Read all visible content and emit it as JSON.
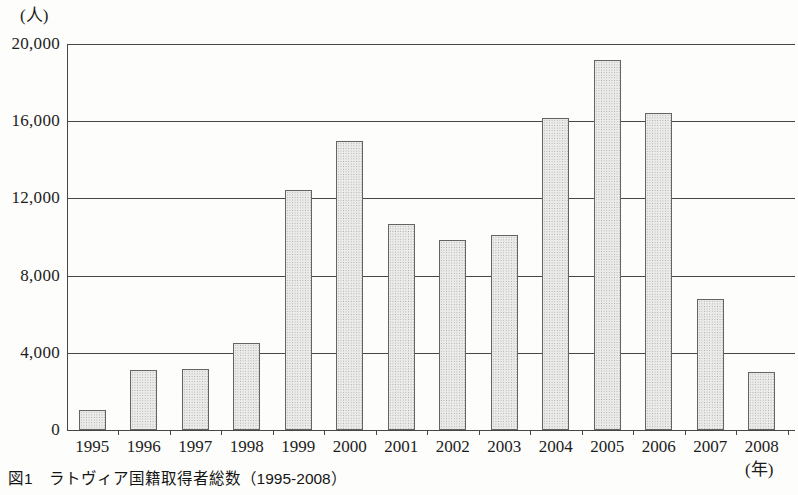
{
  "labels": {
    "y_unit": "(人)",
    "x_unit": "(年)",
    "caption": "図1　ラトヴィア国籍取得者総数（1995-2008）"
  },
  "colors": {
    "bar_fill": "#ebebe9",
    "bar_dot": "#a8a8a6",
    "bar_border": "#646464",
    "axis_line": "#474747",
    "text": "#1c1c1c",
    "background": "#fdfdfb"
  },
  "chart_data": {
    "type": "bar",
    "title": "図1　ラトヴィア国籍取得者総数（1995-2008）",
    "categories": [
      "1995",
      "1996",
      "1997",
      "1998",
      "1999",
      "2000",
      "2001",
      "2002",
      "2003",
      "2004",
      "2005",
      "2006",
      "2007",
      "2008"
    ],
    "values": [
      1050,
      3100,
      3150,
      4500,
      12450,
      14950,
      10650,
      9850,
      10100,
      16150,
      19150,
      16450,
      6800,
      3000
    ],
    "xlabel": "(年)",
    "ylabel": "(人)",
    "ylim": [
      0,
      20000
    ],
    "ytick_step": 4000,
    "ytick_labels": [
      "0",
      "4,000",
      "8,000",
      "12,000",
      "16,000",
      "20,000"
    ],
    "grid": true,
    "legend": "none"
  }
}
